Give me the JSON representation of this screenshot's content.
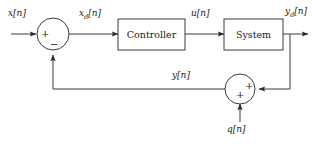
{
  "diagram": {
    "stroke_color": "#3a3a3a",
    "text_color": "#1a1a1a",
    "background": "#ffffff",
    "blocks": [
      {
        "id": "controller",
        "label": "Controller",
        "x": 118,
        "y": 19,
        "w": 67,
        "h": 31
      },
      {
        "id": "system",
        "label": "System",
        "x": 224,
        "y": 19,
        "w": 59,
        "h": 31
      }
    ],
    "summers": [
      {
        "id": "error-summer",
        "cx": 53,
        "cy": 34,
        "r": 16,
        "signs": [
          {
            "op": "+",
            "position": "left"
          },
          {
            "op": "−",
            "position": "bottom"
          }
        ]
      },
      {
        "id": "noise-summer",
        "cx": 240,
        "cy": 89,
        "r": 15,
        "signs": [
          {
            "op": "+",
            "position": "right"
          },
          {
            "op": "+",
            "position": "bottom"
          }
        ]
      }
    ],
    "signals": [
      {
        "id": "input-signal",
        "label": "x[n]",
        "base": "x",
        "sub": "",
        "x": 8,
        "y": 8
      },
      {
        "id": "error-signal",
        "label": "xd[n]",
        "base": "x",
        "sub": "d",
        "x": 79,
        "y": 8
      },
      {
        "id": "control-signal",
        "label": "u[n]",
        "base": "u",
        "sub": "",
        "x": 191,
        "y": 8
      },
      {
        "id": "output-signal",
        "label": "yd[n]",
        "base": "y",
        "sub": "d",
        "x": 285,
        "y": 6
      },
      {
        "id": "feedback-signal",
        "label": "y[n]",
        "base": "y",
        "sub": "",
        "x": 172,
        "y": 70
      },
      {
        "id": "noise-signal",
        "label": "q[n]",
        "base": "q",
        "sub": "",
        "x": 227,
        "y": 124
      }
    ]
  }
}
